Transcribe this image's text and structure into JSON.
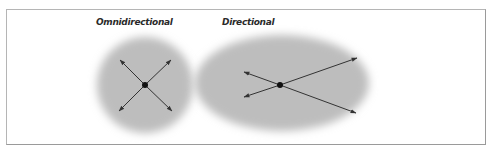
{
  "diagram": {
    "panels": [
      {
        "id": "omnidirectional",
        "title": "Omnidirectional",
        "shape": "circle",
        "center": [
          145,
          85
        ],
        "radius": 50,
        "arrows": [
          [
            120,
            60
          ],
          [
            170,
            60
          ],
          [
            120,
            110
          ],
          [
            170,
            110
          ]
        ]
      },
      {
        "id": "directional",
        "title": "Directional",
        "shape": "ellipse",
        "center": [
          282,
          83
        ],
        "radii": [
          89,
          50
        ],
        "source": [
          280,
          85
        ],
        "arrows": [
          [
            356,
            58
          ],
          [
            354,
            113
          ],
          [
            245,
            72
          ],
          [
            245,
            97
          ]
        ]
      }
    ],
    "colors": {
      "fill": "#bdbdbd",
      "arrow": "#333333",
      "dot": "#111111",
      "border": "#9a9a9a"
    }
  }
}
